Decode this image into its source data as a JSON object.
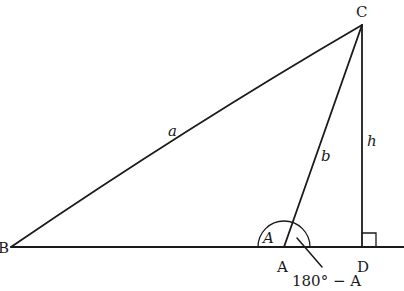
{
  "diagram": {
    "vertices": {
      "B": {
        "label": "B",
        "x": 11,
        "y": 247
      },
      "A": {
        "label": "A",
        "x": 284,
        "y": 247
      },
      "C": {
        "label": "C",
        "x": 362,
        "y": 25
      },
      "D": {
        "label": "D",
        "x": 362,
        "y": 247
      }
    },
    "sides": {
      "a": {
        "label": "a",
        "from": "B",
        "to": "C"
      },
      "b": {
        "label": "b",
        "from": "A",
        "to": "C"
      },
      "h": {
        "label": "h",
        "from": "C",
        "to": "D"
      }
    },
    "angles": {
      "interior": {
        "label": "A"
      },
      "exterior": {
        "label": "180° − A"
      }
    },
    "right_angle_marker": {
      "at": "D",
      "size": 14
    },
    "colors": {
      "stroke": "#1a1a1a",
      "background": "#ffffff"
    }
  }
}
